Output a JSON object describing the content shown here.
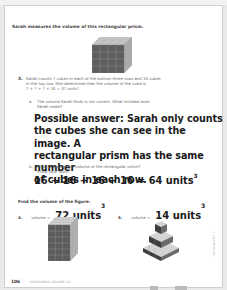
{
  "intro": "Sarah measures the volume of this rectangular prism.",
  "problem3": {
    "number": "3.",
    "text_line1": "Sarah counts 7 cubes in each of the bottom three rows and 16 cubes",
    "text_line2": "in the top row. She determines that the volume of the cube is",
    "text_line3": "7 + 7 + 7 + 16 = 37 units³.",
    "part_a": {
      "label": "a.",
      "question_line1": "The volume Sarah finds is not correct. What mistake does",
      "question_line2": "Sarah make?",
      "answer_lines": [
        "Possible answer: Sarah only counts",
        "the cubes she can see in the image. A",
        "rectangular prism has the same number",
        "of cubes in each row."
      ]
    },
    "part_b": {
      "label": "b.",
      "question_line1": "What is the correct volume of the rectangular prism?",
      "question_line2": "Show your work.",
      "answer": "16 + 16 + 16 + 16 = 64 units",
      "answer_exp": "3"
    }
  },
  "section": {
    "heading": "Find the volume of the figure.",
    "items": [
      {
        "number": "4.",
        "prefix": "volume =",
        "answer": "72 units",
        "exp": "3"
      },
      {
        "number": "5.",
        "prefix": "volume =",
        "answer": "14 units",
        "exp": "3"
      }
    ]
  },
  "footer": {
    "page_number": "106",
    "label": "MEASURING VOLUME 5A"
  },
  "margin_text": "© Great Minds PBC",
  "colors": {
    "cube_front": "#5a5a5a",
    "cube_top": "#c8c8c8",
    "cube_side": "#a8a8a8",
    "grid_line": "#8a8a8a"
  }
}
